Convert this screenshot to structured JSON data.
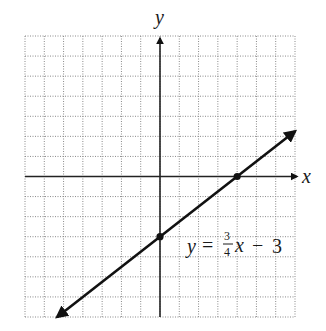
{
  "chart_data": {
    "type": "line",
    "title": "",
    "xlabel": "x",
    "ylabel": "y",
    "xlim": [
      -7,
      7
    ],
    "ylim": [
      -7,
      7
    ],
    "grid": true,
    "grid_style": "dotted",
    "grid_step": 1,
    "axis_arrows": true,
    "series": [
      {
        "name": "y = 3/4x − 3",
        "equation": "y = (3/4)x - 3",
        "slope": 0.75,
        "intercept": -3,
        "x": [
          -5.33,
          7
        ],
        "y": [
          -7,
          2.25
        ],
        "arrows_both_ends": true,
        "color": "#111111"
      }
    ],
    "points": [
      {
        "label": "y-intercept",
        "x": 0,
        "y": -3
      },
      {
        "label": "x-intercept",
        "x": 4,
        "y": 0
      }
    ],
    "annotations": [
      {
        "text_parts": [
          "y",
          "=",
          "3",
          "4",
          "x",
          "−",
          "3"
        ],
        "text": "y = 3/4 x − 3",
        "x": 1.5,
        "y": -3.8
      }
    ]
  },
  "labels": {
    "x_axis": "x",
    "y_axis": "y",
    "eq_y": "y",
    "eq_equals": "=",
    "eq_num": "3",
    "eq_den": "4",
    "eq_x": "x",
    "eq_minus": "−",
    "eq_const": "3"
  },
  "colors": {
    "grid": "#8a8a8a",
    "axis": "#222222",
    "line": "#111111"
  }
}
